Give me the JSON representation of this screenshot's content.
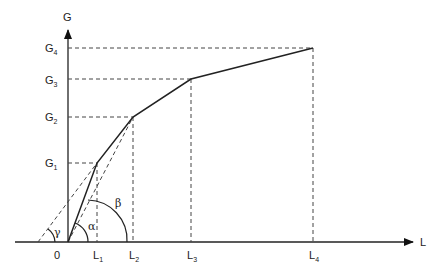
{
  "diagram": {
    "axes": {
      "y_label": "G",
      "x_label": "L",
      "origin_label": "0"
    },
    "y_ticks": [
      {
        "base": "G",
        "sub": "1"
      },
      {
        "base": "G",
        "sub": "2"
      },
      {
        "base": "G",
        "sub": "3"
      },
      {
        "base": "G",
        "sub": "4"
      }
    ],
    "x_ticks": [
      {
        "base": "L",
        "sub": "1"
      },
      {
        "base": "L",
        "sub": "2"
      },
      {
        "base": "L",
        "sub": "3"
      },
      {
        "base": "L",
        "sub": "4"
      }
    ],
    "angles": {
      "alpha": "α",
      "beta": "β",
      "gamma": "γ"
    },
    "colors": {
      "line": "#222222",
      "dash": "#444444",
      "background": "#ffffff"
    }
  }
}
